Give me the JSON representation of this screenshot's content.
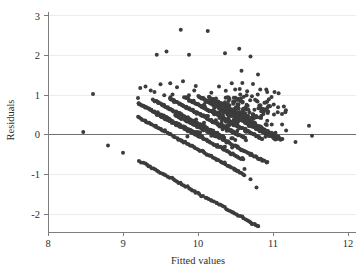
{
  "figure": {
    "kind": "residuals-vs-fitted-scatter",
    "background_color": "#ffffff",
    "marker_color": "#3c3c3c",
    "axis_color": "#7d7d7d",
    "grid_color": "#ececec",
    "zero_line_color": "#6f6f6f"
  },
  "chart_data": {
    "type": "scatter",
    "title": "",
    "subtitle": "",
    "xlabel": "Fitted values",
    "ylabel": "Residuals",
    "xlim": [
      8,
      12
    ],
    "ylim": [
      -2.45,
      3.15
    ],
    "xticks": [
      8,
      9,
      10,
      11,
      12
    ],
    "xticklabels": [
      "8",
      "9",
      "10",
      "11",
      "12"
    ],
    "yticks": [
      -2,
      -1,
      0,
      1,
      2,
      3
    ],
    "yticklabels": [
      "-2",
      "-1",
      "0",
      "1",
      "2",
      "3"
    ],
    "grid": "horizontal-faint",
    "legend": "none",
    "legend_position": "none",
    "reference_lines": [
      {
        "orientation": "horizontal",
        "y": 0,
        "label": "zero residual"
      }
    ],
    "marker_style": "filled-circle",
    "marker_size_px": 4,
    "series": [
      {
        "name": "Residuals",
        "description": "Residuals plotted against fitted values; points fall along parallel descending diagonal bands characteristic of a discrete/integer-valued outcome, plus scattered high-residual outliers.",
        "n_points_approx": 900,
        "bands": [
          {
            "band_id": 1,
            "x_start": 9.2,
            "x_end": 10.05,
            "y_start": 0.8,
            "y_end": -0.04,
            "n": 70
          },
          {
            "band_id": 2,
            "x_start": 9.4,
            "x_end": 10.35,
            "y_start": 0.88,
            "y_end": -0.06,
            "n": 80
          },
          {
            "band_id": 3,
            "x_start": 9.62,
            "x_end": 10.62,
            "y_start": 0.92,
            "y_end": -0.08,
            "n": 85
          },
          {
            "band_id": 4,
            "x_start": 9.82,
            "x_end": 10.85,
            "y_start": 0.95,
            "y_end": -0.1,
            "n": 88
          },
          {
            "band_id": 5,
            "x_start": 10.0,
            "x_end": 11.05,
            "y_start": 0.98,
            "y_end": -0.12,
            "n": 90
          },
          {
            "band_id": 6,
            "x_start": 10.18,
            "x_end": 11.12,
            "y_start": 0.92,
            "y_end": -0.12,
            "n": 80
          },
          {
            "band_id": 7,
            "x_start": 9.45,
            "x_end": 10.6,
            "y_start": 0.52,
            "y_end": -0.62,
            "n": 70
          },
          {
            "band_id": 8,
            "x_start": 9.7,
            "x_end": 10.92,
            "y_start": 0.5,
            "y_end": -0.7,
            "n": 72
          },
          {
            "band_id": 9,
            "x_start": 9.2,
            "x_end": 10.62,
            "y_start": 0.45,
            "y_end": -1.0,
            "n": 75
          },
          {
            "band_id": 10,
            "x_start": 9.22,
            "x_end": 10.8,
            "y_start": -0.66,
            "y_end": -2.3,
            "n": 68
          }
        ],
        "cloud": {
          "x_range": [
            9.85,
            11.15
          ],
          "y_range": [
            -0.35,
            1.35
          ],
          "center_x": 10.55,
          "center_y": 0.55,
          "n": 260
        },
        "outliers": [
          {
            "x": 8.47,
            "y": 0.07
          },
          {
            "x": 8.6,
            "y": 1.03
          },
          {
            "x": 8.8,
            "y": -0.27
          },
          {
            "x": 9.0,
            "y": -0.45
          },
          {
            "x": 9.2,
            "y": 0.93
          },
          {
            "x": 9.23,
            "y": 1.18
          },
          {
            "x": 9.3,
            "y": 1.22
          },
          {
            "x": 9.37,
            "y": 1.12
          },
          {
            "x": 9.42,
            "y": 1.08
          },
          {
            "x": 9.45,
            "y": 2.02
          },
          {
            "x": 9.5,
            "y": 1.28
          },
          {
            "x": 9.55,
            "y": 1.0
          },
          {
            "x": 9.58,
            "y": 2.1
          },
          {
            "x": 9.63,
            "y": 1.3
          },
          {
            "x": 9.66,
            "y": 1.02
          },
          {
            "x": 9.72,
            "y": 1.2
          },
          {
            "x": 9.77,
            "y": 2.65
          },
          {
            "x": 9.8,
            "y": 1.35
          },
          {
            "x": 9.88,
            "y": 2.02
          },
          {
            "x": 9.95,
            "y": 1.12
          },
          {
            "x": 10.13,
            "y": 2.62
          },
          {
            "x": 10.28,
            "y": 1.22
          },
          {
            "x": 10.36,
            "y": 2.06
          },
          {
            "x": 10.45,
            "y": 1.3
          },
          {
            "x": 10.55,
            "y": 2.17
          },
          {
            "x": 10.58,
            "y": 1.62
          },
          {
            "x": 10.7,
            "y": 1.98
          },
          {
            "x": 10.8,
            "y": 1.52
          },
          {
            "x": 10.62,
            "y": -0.86
          },
          {
            "x": 10.7,
            "y": -1.12
          },
          {
            "x": 10.78,
            "y": -1.33
          },
          {
            "x": 10.72,
            "y": -2.25
          },
          {
            "x": 10.8,
            "y": -2.3
          },
          {
            "x": 11.02,
            "y": 1.08
          },
          {
            "x": 11.1,
            "y": -0.12
          },
          {
            "x": 11.3,
            "y": -0.18
          },
          {
            "x": 11.48,
            "y": 0.23
          },
          {
            "x": 11.52,
            "y": -0.02
          }
        ]
      }
    ]
  }
}
